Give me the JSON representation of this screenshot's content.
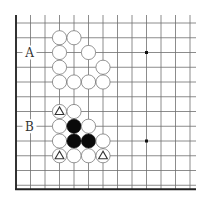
{
  "board": {
    "cols": 13,
    "rows": 12,
    "origin_x": 16,
    "origin_y": 23,
    "spacing_x": 14.5,
    "spacing_y": 14.75,
    "edges": [
      "left",
      "bottom"
    ],
    "star_points": [
      [
        9,
        2
      ],
      [
        9,
        8
      ]
    ],
    "line_color": "#6e6e6e",
    "edge_color": "#222222"
  },
  "labels": [
    {
      "text": "A",
      "row": 2
    },
    {
      "text": "B",
      "row": 7
    }
  ],
  "stones": [
    {
      "color": "white",
      "col": 3,
      "row": 1
    },
    {
      "color": "white",
      "col": 4,
      "row": 1
    },
    {
      "color": "white",
      "col": 3,
      "row": 2
    },
    {
      "color": "white",
      "col": 5,
      "row": 2
    },
    {
      "color": "white",
      "col": 3,
      "row": 3
    },
    {
      "color": "white",
      "col": 6,
      "row": 3
    },
    {
      "color": "white",
      "col": 3,
      "row": 4
    },
    {
      "color": "white",
      "col": 4,
      "row": 4
    },
    {
      "color": "white",
      "col": 5,
      "row": 4
    },
    {
      "color": "white",
      "col": 6,
      "row": 4
    },
    {
      "color": "white",
      "col": 3,
      "row": 6,
      "mark": "triangle"
    },
    {
      "color": "white",
      "col": 4,
      "row": 6
    },
    {
      "color": "white",
      "col": 3,
      "row": 7
    },
    {
      "color": "black",
      "col": 4,
      "row": 7
    },
    {
      "color": "white",
      "col": 5,
      "row": 7
    },
    {
      "color": "white",
      "col": 3,
      "row": 8
    },
    {
      "color": "black",
      "col": 4,
      "row": 8
    },
    {
      "color": "black",
      "col": 5,
      "row": 8
    },
    {
      "color": "white",
      "col": 6,
      "row": 8
    },
    {
      "color": "white",
      "col": 3,
      "row": 9,
      "mark": "triangle"
    },
    {
      "color": "white",
      "col": 4,
      "row": 9
    },
    {
      "color": "white",
      "col": 5,
      "row": 9
    },
    {
      "color": "white",
      "col": 6,
      "row": 9,
      "mark": "triangle"
    }
  ]
}
